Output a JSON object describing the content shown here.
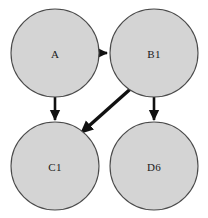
{
  "diagram": {
    "type": "directed-graph",
    "background_color": "#ffffff",
    "node_fill_color": "#d4d4d4",
    "node_stroke_color": "#4a4a4a",
    "edge_color": "#111111",
    "label_color": "#1a1a1a",
    "nodes": [
      {
        "id": "A",
        "label": "A",
        "cx": 55,
        "cy": 53,
        "r": 44
      },
      {
        "id": "B1",
        "label": "B1",
        "cx": 154,
        "cy": 53,
        "r": 44
      },
      {
        "id": "C1",
        "label": "C1",
        "cx": 55,
        "cy": 166,
        "r": 44
      },
      {
        "id": "D6",
        "label": "D6",
        "cx": 154,
        "cy": 166,
        "r": 44
      }
    ],
    "edges": [
      {
        "id": "a-to-b1",
        "from": "A",
        "to": "B1",
        "orientation": "horizontal",
        "x1": 99,
        "y1": 53,
        "x2": 107,
        "y2": 53,
        "width": 2.6
      },
      {
        "id": "a-to-c1",
        "from": "A",
        "to": "C1",
        "orientation": "vertical",
        "x1": 55,
        "y1": 97,
        "x2": 55,
        "y2": 120,
        "width": 2.6
      },
      {
        "id": "b1-to-c1",
        "from": "B1",
        "to": "C1",
        "orientation": "diagonal",
        "x1": 136,
        "y1": 84,
        "x2": 81,
        "y2": 133,
        "width": 3.4
      },
      {
        "id": "b1-to-d6",
        "from": "B1",
        "to": "D6",
        "orientation": "vertical",
        "x1": 154,
        "y1": 97,
        "x2": 154,
        "y2": 120,
        "width": 2.6
      }
    ]
  }
}
